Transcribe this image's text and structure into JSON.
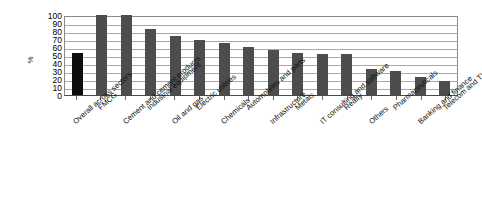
{
  "chart_data": {
    "type": "bar",
    "title": "",
    "xlabel": "",
    "ylabel": "%",
    "ylim": [
      0,
      100
    ],
    "yticks": [
      100,
      90,
      80,
      70,
      60,
      50,
      40,
      30,
      20,
      10,
      0
    ],
    "grid": true,
    "legend": "none",
    "categories": [
      "Overall across sectors",
      "FMCG",
      "Cement and cement products",
      "Industrial equipment",
      "Oil and gas",
      "Electric utilities",
      "Chemicals",
      "Automobiles and parts",
      "Infrastructure",
      "Metals",
      "IT consulting and software",
      "Realty",
      "Others",
      "Pharmaceuticals",
      "Banking and finance",
      "Telecom and TV"
    ],
    "values": [
      53,
      100,
      100,
      82,
      74,
      69,
      65,
      60,
      56,
      52,
      51,
      51,
      33,
      30,
      22,
      17
    ],
    "bar_colors": [
      "#0d0d0d",
      "#4d4d4d",
      "#4d4d4d",
      "#4d4d4d",
      "#4d4d4d",
      "#4d4d4d",
      "#4d4d4d",
      "#4d4d4d",
      "#4d4d4d",
      "#4d4d4d",
      "#4d4d4d",
      "#4d4d4d",
      "#4d4d4d",
      "#4d4d4d",
      "#4d4d4d",
      "#4d4d4d"
    ],
    "highlight_index": 0,
    "colors": {
      "bar_default": "#4d4d4d",
      "bar_highlight": "#0d0d0d",
      "gridline": "#a8a8a8",
      "axis": "#4a4a4a",
      "background": "#ffffff",
      "text": "#111111"
    }
  }
}
